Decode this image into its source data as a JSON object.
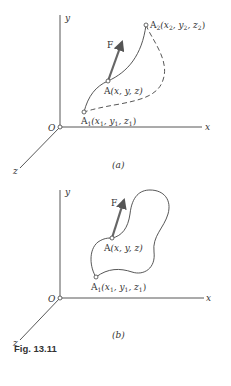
{
  "panel_a": {
    "axis_y": "y",
    "axis_x": "x",
    "axis_z": "z",
    "origin": "O",
    "force": "F",
    "point_a2": "A",
    "point_a2_sub": "2",
    "point_a2_coords": "(x",
    "point_a": "A(x, y, z)",
    "point_a1": "A",
    "point_a1_sub": "1",
    "label": "(a)"
  },
  "panel_b": {
    "axis_y": "y",
    "axis_x": "x",
    "axis_z": "z",
    "origin": "O",
    "force": "F",
    "point_a": "A(x, y, z)",
    "point_a1": "A",
    "label": "(b)"
  },
  "caption": "Fig. 13.11"
}
